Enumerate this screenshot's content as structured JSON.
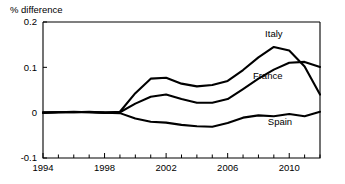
{
  "chart_data": {
    "type": "line",
    "title": "",
    "ylabel": "% difference",
    "xlabel": "",
    "ylim": [
      -0.1,
      0.2
    ],
    "xlim": [
      1994,
      2012
    ],
    "grid": false,
    "legend_position": "inline-annotations",
    "y_ticks": [
      "0.2",
      "0.1",
      "0",
      "-0.1"
    ],
    "y_tick_values": [
      0.2,
      0.1,
      0,
      -0.1
    ],
    "x_ticks": [
      "1994",
      "1998",
      "2002",
      "2006",
      "2010"
    ],
    "x_tick_values": [
      1994,
      1998,
      2002,
      2006,
      2010
    ],
    "x_minor_ticks": [
      1995,
      1996,
      1997,
      1999,
      2000,
      2001,
      2003,
      2004,
      2005,
      2007,
      2008,
      2009,
      2011,
      2012
    ],
    "x": [
      1994,
      1995,
      1996,
      1997,
      1998,
      1999,
      2000,
      2001,
      2002,
      2003,
      2004,
      2005,
      2006,
      2007,
      2008,
      2009,
      2010,
      2011,
      2012
    ],
    "series": [
      {
        "name": "Italy",
        "color": "#000000",
        "values": [
          0.0,
          0.001,
          0.002,
          0.001,
          0.0,
          0.002,
          0.043,
          0.075,
          0.077,
          0.064,
          0.058,
          0.061,
          0.07,
          0.094,
          0.122,
          0.145,
          0.137,
          0.102,
          0.04
        ]
      },
      {
        "name": "France",
        "color": "#000000",
        "values": [
          0.0,
          0.001,
          0.001,
          0.001,
          0.0,
          0.001,
          0.02,
          0.035,
          0.04,
          0.03,
          0.022,
          0.022,
          0.03,
          0.052,
          0.075,
          0.095,
          0.11,
          0.112,
          0.101
        ]
      },
      {
        "name": "Spain",
        "color": "#000000",
        "values": [
          0.0,
          0.001,
          0.001,
          0.002,
          0.0,
          -0.001,
          -0.013,
          -0.02,
          -0.022,
          -0.027,
          -0.03,
          -0.031,
          -0.023,
          -0.011,
          -0.006,
          -0.008,
          -0.003,
          -0.008,
          0.002
        ]
      }
    ],
    "annotations": [
      {
        "text": "Italy",
        "x": 2009.0,
        "y": 0.168,
        "anchor": "middle"
      },
      {
        "text": "France",
        "x": 2008.6,
        "y": 0.075,
        "anchor": "middle"
      },
      {
        "text": "Spain",
        "x": 2009.4,
        "y": -0.028,
        "anchor": "middle"
      }
    ]
  }
}
